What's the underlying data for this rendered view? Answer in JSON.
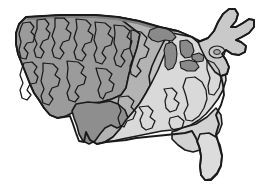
{
  "figure": {
    "style": "hand-drawn grayscale regional shading",
    "background_color": "#ffffff",
    "outline_color": "#1a1a1a",
    "width_px": 262,
    "height_px": 186
  },
  "palette": {
    "background": "#ffffff",
    "outline": "#1a1a1a",
    "west": "#9b9b9b",
    "southwest": "#8e8e8e",
    "plains": "#b3b3b3",
    "midwest": "#c2c2c2",
    "east": "#d9d9d9",
    "southeast": "#d2d2d2",
    "florida": "#dcdcdc",
    "northeast": "#c9c9c9",
    "great_lakes": "#8a8a8a",
    "shadow": "#7e7e7e"
  },
  "regions": [
    {
      "id": "west",
      "label": "Western region",
      "fill": "#9b9b9b",
      "shading": "dark gray"
    },
    {
      "id": "southwest",
      "label": "Southwest region",
      "fill": "#8e8e8e",
      "shading": "darker gray patch"
    },
    {
      "id": "plains",
      "label": "Great Plains region",
      "fill": "#b3b3b3",
      "shading": "medium gray"
    },
    {
      "id": "midwest",
      "label": "Midwest region",
      "fill": "#c2c2c2",
      "shading": "medium light gray"
    },
    {
      "id": "east",
      "label": "Eastern region",
      "fill": "#d9d9d9",
      "shading": "light gray"
    },
    {
      "id": "southeast",
      "label": "Southeast region",
      "fill": "#d2d2d2",
      "shading": "light gray"
    },
    {
      "id": "florida",
      "label": "Florida peninsula",
      "fill": "#dcdcdc",
      "shading": "lightest gray"
    },
    {
      "id": "northeast",
      "label": "Northeast region",
      "fill": "#c9c9c9",
      "shading": "medium light gray"
    }
  ],
  "features": [
    {
      "id": "great-lakes",
      "label": "Great Lakes",
      "fill": "#8a8a8a"
    },
    {
      "id": "lake-ontario-ring",
      "label": "Lake Ontario",
      "fill": "#c9c9c9"
    },
    {
      "id": "northern-border",
      "label": "Northern border",
      "fill": "#7e7e7e"
    }
  ],
  "caption": ""
}
